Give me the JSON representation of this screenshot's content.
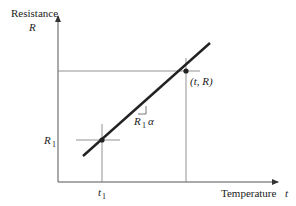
{
  "diagram": {
    "type": "line-graph",
    "y_axis": {
      "title": "Resistance",
      "symbol": "R"
    },
    "x_axis": {
      "title": "Temperature",
      "symbol": "t"
    },
    "points": [
      {
        "name": "reference-point",
        "label_main": "R",
        "label_sub": "1",
        "x_label_main": "t",
        "x_label_sub": "1"
      },
      {
        "name": "general-point",
        "label": "(t, R)"
      }
    ],
    "slope_label": {
      "main": "R",
      "sub": "1",
      "greek": "α"
    },
    "colors": {
      "line": "#222222",
      "axis": "#555555",
      "guide": "#777777"
    }
  }
}
